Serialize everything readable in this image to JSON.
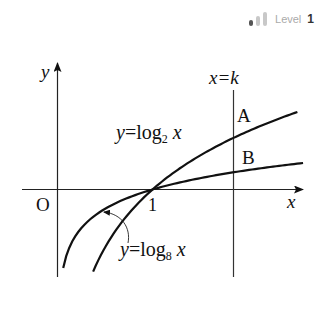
{
  "badge": {
    "label": "Level",
    "level": "1",
    "filled_bars": 1,
    "total_bars": 3
  },
  "diagram": {
    "axis_x_label": "x",
    "axis_y_label": "y",
    "origin_label": "O",
    "tick_one_label": "1",
    "vertical_line_label": "x=k",
    "point_a_label": "A",
    "point_b_label": "B",
    "curve_log2": {
      "prefix": "y=log",
      "base": "2",
      "suffix": " x",
      "base_value": 2
    },
    "curve_log8": {
      "prefix": "y=log",
      "base": "8",
      "suffix": " x",
      "base_value": 8
    },
    "k_value": 1.85
  }
}
